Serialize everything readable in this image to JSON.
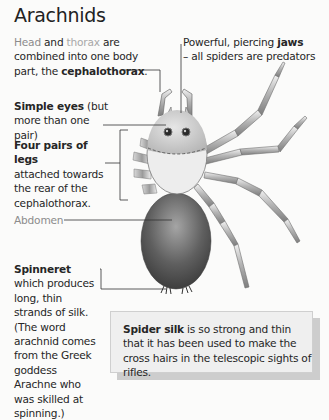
{
  "title": "Arachnids",
  "labels": {
    "cephalothorax": {
      "part1": "Head",
      "part2": " and ",
      "part3": "thorax",
      "part4": " are combined into one body part, the ",
      "bold": "cephalothorax",
      "end": "."
    },
    "jaws": {
      "text": "Powerful, piercing ",
      "bold": "jaws",
      "line2": "– all spiders are predators"
    },
    "eyes": {
      "bold": "Simple eyes",
      "text": " (but more than one pair)"
    },
    "legs": {
      "bold": "Four pairs of legs",
      "text": "attached towards the rear of the cephalothorax."
    },
    "abdomen": {
      "text": "Abdomen"
    },
    "spinneret": {
      "bold": "Spinneret",
      "text": " which produces long, thin strands of silk. (The word arachnid comes from the Greek goddess Arachne who was skilled at spinning.)"
    }
  },
  "callout": {
    "bold": "Spider silk",
    "text": " is so strong and thin that it has been used to make the cross hairs in the telescopic sights of rifles."
  },
  "colors": {
    "background": "#fbfbfa",
    "text": "#262626",
    "muted_text": "#8c8c8c",
    "abdomen": "#5a5a5a",
    "cephalothorax": "#ececec",
    "legs": "#b8b8b8",
    "callout_bg": "#efefef"
  }
}
